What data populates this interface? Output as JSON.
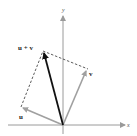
{
  "diagram": {
    "type": "vector-addition-parallelogram",
    "axes": {
      "x_label": "x",
      "y_label": "y",
      "color": "#9a9a9a"
    },
    "vectors": {
      "u": {
        "label": "u",
        "color": "#a0a0a0"
      },
      "v": {
        "label": "v",
        "color": "#a0a0a0"
      },
      "sum": {
        "label": "u + v",
        "color": "#111111"
      }
    },
    "dashed_color": "#333333"
  }
}
